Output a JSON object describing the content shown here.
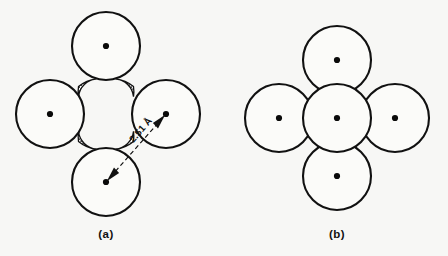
{
  "figure": {
    "background_color": "#f7f7f5",
    "stroke_color": "#111111",
    "circle_fill_color": "#fbfbf9",
    "stipple_fill_color": "#111111",
    "width": 448,
    "height": 256
  },
  "panels": [
    {
      "id": "a",
      "caption": "(a)",
      "caption_x": 106,
      "caption_y": 238,
      "description": "four mutually tangent circles with stippled interstitial void",
      "circle_radius": 34,
      "has_stipple": true,
      "has_dimension": true,
      "atoms": [
        {
          "name": "atom-top",
          "cx": 106,
          "cy": 46,
          "r": 34
        },
        {
          "name": "atom-left",
          "cx": 50,
          "cy": 114,
          "r": 34
        },
        {
          "name": "atom-right",
          "cx": 166,
          "cy": 114,
          "r": 34
        },
        {
          "name": "atom-bottom",
          "cx": 106,
          "cy": 182,
          "r": 34
        }
      ],
      "dimension": {
        "label": "2.51 Å",
        "value": 2.51,
        "unit": "Å",
        "from_x": 106,
        "from_y": 182,
        "to_x": 166,
        "to_y": 114,
        "label_x": 143,
        "label_y": 132,
        "label_rotation": -49,
        "style": "dashed double-headed arrow"
      }
    },
    {
      "id": "b",
      "caption": "(b)",
      "caption_x": 337,
      "caption_y": 238,
      "description": "five overlapping circles, four outer plus one central",
      "circle_radius": 34,
      "has_stipple": false,
      "has_dimension": false,
      "atoms": [
        {
          "name": "atom-top",
          "cx": 337,
          "cy": 60,
          "r": 34
        },
        {
          "name": "atom-left",
          "cx": 279,
          "cy": 118,
          "r": 34
        },
        {
          "name": "atom-center",
          "cx": 337,
          "cy": 118,
          "r": 34
        },
        {
          "name": "atom-right",
          "cx": 395,
          "cy": 118,
          "r": 34
        },
        {
          "name": "atom-bottom",
          "cx": 337,
          "cy": 176,
          "r": 34
        }
      ]
    }
  ]
}
